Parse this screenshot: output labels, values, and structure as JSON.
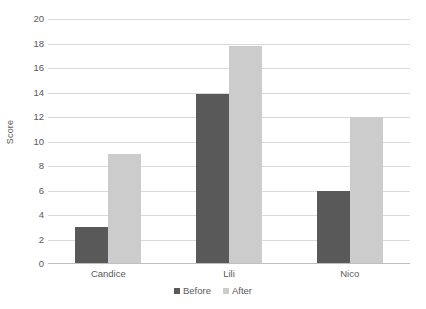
{
  "chart_data": {
    "type": "bar",
    "title": "",
    "subtitle": "",
    "xlabel": "",
    "ylabel": "Score",
    "categories": [
      "Candice",
      "Lili",
      "Nico"
    ],
    "series": [
      {
        "name": "Before",
        "values": [
          3,
          13.9,
          6
        ],
        "color": "#595959"
      },
      {
        "name": "After",
        "values": [
          9,
          17.8,
          12
        ],
        "color": "#cccccc"
      }
    ],
    "ylim": [
      0,
      20
    ],
    "ytick_step": 2,
    "yticks": [
      20,
      18,
      16,
      14,
      12,
      10,
      8,
      6,
      4,
      2,
      0
    ],
    "grid": true,
    "grid_axis": "y",
    "legend_position": "bottom",
    "background_color": "#ffffff",
    "gridline_color": "#d9d9d9",
    "text_color": "#595959"
  },
  "legend": {
    "items": [
      {
        "label": "Before",
        "swatch_name": "legend-swatch-before"
      },
      {
        "label": "After",
        "swatch_name": "legend-swatch-after"
      }
    ]
  }
}
